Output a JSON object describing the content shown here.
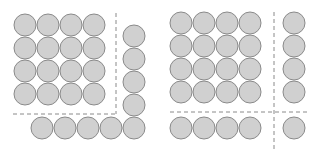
{
  "figures": [
    {
      "name": "left-figure",
      "description": "4x4 square of circles plus an L-shaped gnomon (column of 5 on right, row of 5 on bottom sharing corner)",
      "grid": {
        "rows": 4,
        "cols": 4,
        "x0": 25,
        "y0": 25,
        "step": 23
      },
      "radius": 11,
      "extra_circles": [
        {
          "cx": 134,
          "cy": 36
        },
        {
          "cx": 134,
          "cy": 59
        },
        {
          "cx": 134,
          "cy": 82
        },
        {
          "cx": 134,
          "cy": 105
        },
        {
          "cx": 134,
          "cy": 128
        },
        {
          "cx": 42,
          "cy": 128
        },
        {
          "cx": 65,
          "cy": 128
        },
        {
          "cx": 88,
          "cy": 128
        },
        {
          "cx": 111,
          "cy": 128
        }
      ],
      "dashed_lines": [
        {
          "x1": 116,
          "y1": 13,
          "x2": 116,
          "y2": 114
        },
        {
          "x1": 13,
          "y1": 114,
          "x2": 116,
          "y2": 114
        }
      ]
    },
    {
      "name": "right-figure",
      "description": "4x4 square of circles plus separated column of 4, row of 4, and a single corner circle",
      "grid": {
        "rows": 4,
        "cols": 4,
        "x0": 181,
        "y0": 23,
        "step": 23
      },
      "radius": 11,
      "extra_circles": [
        {
          "cx": 294,
          "cy": 23
        },
        {
          "cx": 294,
          "cy": 46
        },
        {
          "cx": 294,
          "cy": 69
        },
        {
          "cx": 294,
          "cy": 92
        },
        {
          "cx": 181,
          "cy": 128
        },
        {
          "cx": 204,
          "cy": 128
        },
        {
          "cx": 227,
          "cy": 128
        },
        {
          "cx": 250,
          "cy": 128
        },
        {
          "cx": 294,
          "cy": 128
        }
      ],
      "dashed_lines": [
        {
          "x1": 274,
          "y1": 12,
          "x2": 274,
          "y2": 150
        },
        {
          "x1": 170,
          "y1": 112,
          "x2": 310,
          "y2": 112
        }
      ]
    }
  ],
  "colors": {
    "fill": "#d0d0d0",
    "stroke": "#8a8a8a",
    "background": "#ffffff"
  }
}
